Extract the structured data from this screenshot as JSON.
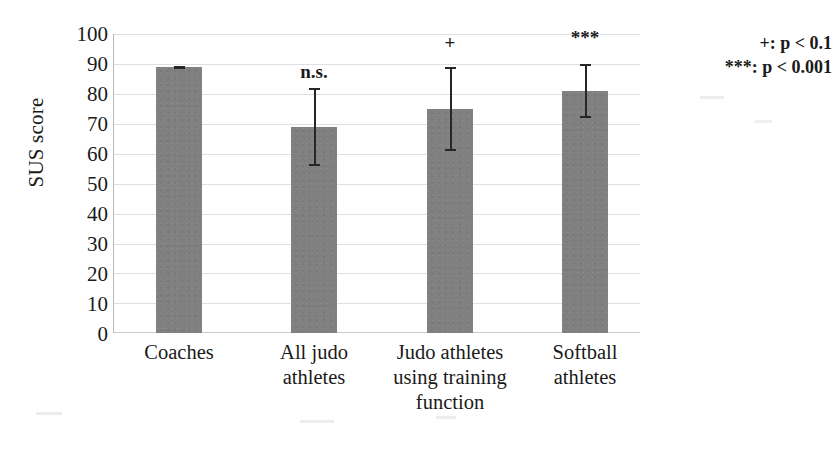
{
  "chart_data": {
    "type": "bar",
    "title": "",
    "xlabel": "",
    "ylabel": "SUS score",
    "ylim": [
      0,
      100
    ],
    "ytick_step": 10,
    "grid": true,
    "legend_position": "top-right outside",
    "bar_color": "#808080",
    "errorbar_color": "#262626",
    "gridline_color": "#dfdfe4",
    "categories": [
      "Coaches",
      "All judo athletes",
      "Judo athletes using training function",
      "Softball athletes"
    ],
    "category_lines": [
      [
        "Coaches"
      ],
      [
        "All judo",
        "athletes"
      ],
      [
        "Judo athletes",
        "using training",
        "function"
      ],
      [
        "Softball",
        "athletes"
      ]
    ],
    "values": [
      89,
      69,
      75,
      81
    ],
    "error_low": [
      88.4,
      56,
      61,
      72
    ],
    "error_high": [
      89.4,
      82,
      89,
      90
    ],
    "annotations": [
      "",
      "n.s.",
      "+",
      "***"
    ],
    "ytick_labels": [
      "100",
      "90",
      "80",
      "70",
      "60",
      "50",
      "40",
      "30",
      "20",
      "10",
      "0"
    ],
    "ytick_values": [
      100,
      90,
      80,
      70,
      60,
      50,
      40,
      30,
      20,
      10,
      0
    ],
    "legend": [
      "+: p < 0.1",
      "***: p < 0.001"
    ]
  }
}
